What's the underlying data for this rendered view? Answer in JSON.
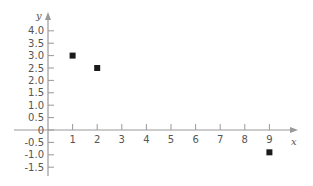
{
  "chart_data": {
    "type": "scatter",
    "title": "",
    "xlabel": "x",
    "ylabel": "y",
    "x": [
      1,
      2,
      9
    ],
    "y": [
      3.0,
      2.5,
      -0.9
    ],
    "points": [
      {
        "x": 1,
        "y": 3.0
      },
      {
        "x": 2,
        "y": 2.5
      },
      {
        "x": 9,
        "y": -0.9
      }
    ],
    "xticks": [
      1,
      2,
      3,
      4,
      5,
      6,
      7,
      8,
      9
    ],
    "xtick_labels": [
      "1",
      "2",
      "3",
      "4",
      "5",
      "6",
      "7",
      "8",
      "9"
    ],
    "yticks": [
      4.0,
      3.5,
      3.0,
      2.5,
      2.0,
      1.5,
      1.0,
      0.5,
      0,
      -0.5,
      -1.0,
      -1.5
    ],
    "ytick_labels": [
      "4.0",
      "3.5",
      "3.0",
      "2.5",
      "2.0",
      "1.5",
      "1.0",
      "0.5",
      "0",
      "-0.5",
      "-1.0",
      "-1.5"
    ],
    "xlim": [
      -0.3,
      10.1
    ],
    "ylim": [
      -1.8,
      4.6
    ],
    "grid": false,
    "legend": null,
    "marker": "square",
    "colors": {
      "axis": "#999999",
      "marker": "#1a1a1a",
      "text": "#555555"
    }
  }
}
